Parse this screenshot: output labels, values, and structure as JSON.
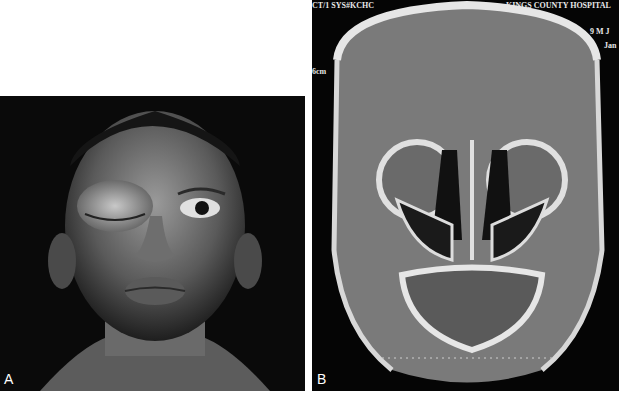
{
  "figure": {
    "panels": [
      {
        "label": "A",
        "description": "Photograph of a boy with marked swelling of the right upper eyelid (periorbital swelling), eye closed"
      },
      {
        "label": "B",
        "description": "Coronal CT scan of the sinuses showing opacification of paranasal sinuses"
      }
    ],
    "ct_overlay": {
      "top_left": "CT/1 SYS#KCHC",
      "top_center": "PS",
      "top_right": "KINGS COUNTY HOSPITAL",
      "right_line1": "9 M J",
      "right_line2": "Jan",
      "left_side": "6cm"
    },
    "colors": {
      "background": "#ffffff",
      "panel_bg": "#0a0a0a",
      "ct_tissue": "#7a7a7a",
      "bone": "#e6e6e6"
    }
  }
}
